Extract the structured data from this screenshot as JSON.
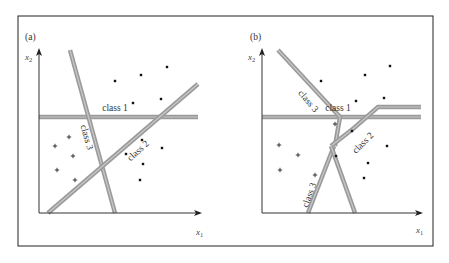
{
  "figure": {
    "frame": {
      "x": 18,
      "y": 16,
      "w": 415,
      "h": 230
    },
    "panels": [
      {
        "id": "a",
        "label": "(a)",
        "label_pos": [
          25,
          40
        ],
        "origin": [
          39,
          213
        ],
        "x_axis_end": 200,
        "y_axis_end": 50,
        "x_label": "x",
        "x_sub": "1",
        "x_label_pos": [
          196,
          235
        ],
        "y_label": "x",
        "y_sub": "2",
        "y_label_pos": [
          25,
          60
        ],
        "boundaries": [
          {
            "name": "class 1",
            "points": [
              [
                39,
                117
              ],
              [
                198,
                117
              ]
            ],
            "label": "class 1",
            "label_pos": [
              115,
              111
            ],
            "label_rot": 0
          },
          {
            "name": "class 3",
            "points": [
              [
                70,
                50
              ],
              [
                115,
                213
              ]
            ],
            "label": "class 3",
            "label_pos": [
              84,
              138
            ],
            "label_rot": 74
          },
          {
            "name": "class 2",
            "points": [
              [
                48,
                213
              ],
              [
                198,
                84
              ]
            ],
            "label": "class 2",
            "label_pos": [
              140,
              153
            ],
            "label_rot": -42
          }
        ],
        "dots": [
          [
            115,
            81
          ],
          [
            141,
            75
          ],
          [
            167,
            67
          ],
          [
            133,
            103
          ],
          [
            161,
            99
          ],
          [
            126,
            154
          ],
          [
            142,
            140
          ],
          [
            162,
            148
          ],
          [
            143,
            164
          ],
          [
            140,
            180
          ]
        ],
        "plus": [
          [
            69,
            137
          ],
          [
            55,
            146
          ],
          [
            73,
            156
          ],
          [
            57,
            170
          ],
          [
            75,
            180
          ]
        ]
      },
      {
        "id": "b",
        "label": "(b)",
        "label_pos": [
          250,
          40
        ],
        "origin": [
          262,
          213
        ],
        "x_axis_end": 421,
        "y_axis_end": 50,
        "x_label": "x",
        "x_sub": "1",
        "x_label_pos": [
          416,
          233
        ],
        "y_label": "x",
        "y_sub": "2",
        "y_label_pos": [
          248,
          60
        ],
        "boundaries": [
          {
            "name": "class 1",
            "points": [
              [
                262,
                117
              ],
              [
                421,
                117
              ]
            ],
            "label": "class 1",
            "label_pos": [
              338,
              111
            ],
            "label_rot": 0
          },
          {
            "name": "class 3 upper",
            "points": [
              [
                278,
                50
              ],
              [
                340,
                117
              ],
              [
                335,
                146
              ]
            ],
            "label": "class 3",
            "label_pos": [
              306,
              103
            ],
            "label_rot": 50
          },
          {
            "name": "class 2",
            "points": [
              [
                331,
                146
              ],
              [
                354,
                128
              ],
              [
                378,
                107
              ],
              [
                421,
                107
              ]
            ],
            "label": "class 2",
            "label_pos": [
              365,
              145
            ],
            "label_rot": -45
          },
          {
            "name": "class 3 lower",
            "points": [
              [
                334,
                146
              ],
              [
                308,
                213
              ]
            ],
            "label": "class 3",
            "label_pos": [
              312,
              196
            ],
            "label_rot": -70
          },
          {
            "name": "class 2 lower",
            "points": [
              [
                331,
                146
              ],
              [
                355,
                213
              ]
            ],
            "label": "",
            "label_pos": [
              0,
              0
            ],
            "label_rot": 0
          }
        ],
        "dots": [
          [
            321,
            81
          ],
          [
            365,
            75
          ],
          [
            390,
            66
          ],
          [
            356,
            101
          ],
          [
            384,
            98
          ],
          [
            352,
            131
          ],
          [
            336,
            156
          ],
          [
            387,
            146
          ],
          [
            368,
            163
          ],
          [
            364,
            178
          ]
        ],
        "plus": [
          [
            335,
            124
          ],
          [
            279,
            145
          ],
          [
            298,
            155
          ],
          [
            280,
            170
          ],
          [
            315,
            175
          ]
        ]
      }
    ]
  }
}
